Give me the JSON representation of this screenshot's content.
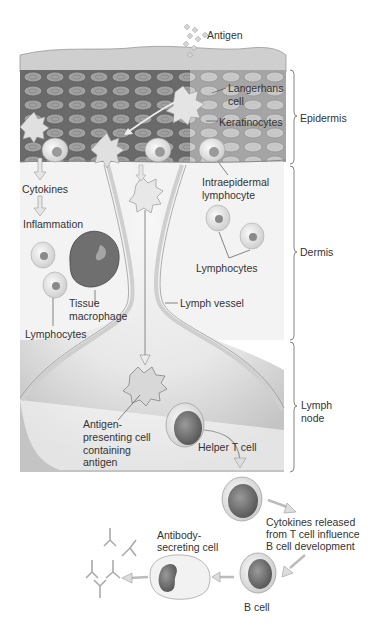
{
  "figure": {
    "labels": {
      "antigen": "Antigen",
      "langerhans_cell_1": "Langerhans",
      "langerhans_cell_2": "cell",
      "keratinocytes": "Keratinocytes",
      "cytokines": "Cytokines",
      "inflammation": "Inflammation",
      "intraepidermal_1": "Intraepidermal",
      "intraepidermal_2": "lymphocyte",
      "lymphocytes_right": "Lymphocytes",
      "tissue_macrophage_1": "Tissue",
      "tissue_macrophage_2": "macrophage",
      "lymph_vessel": "Lymph vessel",
      "lymphocytes_left": "Lymphocytes",
      "apc_1": "Antigen-",
      "apc_2": "presenting cell",
      "apc_3": "containing",
      "apc_4": "antigen",
      "helper_t_cell": "Helper T cell",
      "cytokines_released_1": "Cytokines released",
      "cytokines_released_2": "from T cell influence",
      "cytokines_released_3": "B cell development",
      "antibody_secreting_1": "Antibody-",
      "antibody_secreting_2": "secreting cell",
      "b_cell": "B cell"
    },
    "regions": {
      "epidermis": "Epidermis",
      "dermis": "Dermis",
      "lymph_node_1": "Lymph",
      "lymph_node_2": "node"
    },
    "colors": {
      "skin_dark": "#6f6f6f",
      "skin_cell": "#9a9a9a",
      "skin_surface": "#c8c8c8",
      "dermis_bg": "#f2f2f2",
      "vessel_wall": "#d9d9d9",
      "node_shade": "#cfcfcf",
      "arrow": "#b5b5b5",
      "line": "#555555"
    }
  }
}
